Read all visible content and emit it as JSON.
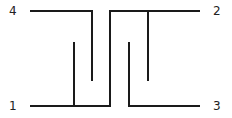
{
  "diagram": {
    "type": "interdigitated-coupler-schematic",
    "ports": [
      {
        "id": "port-4",
        "label": "4",
        "x": 13,
        "y": 15
      },
      {
        "id": "port-2",
        "label": "2",
        "x": 213,
        "y": 15
      },
      {
        "id": "port-1",
        "label": "1",
        "x": 13,
        "y": 110
      },
      {
        "id": "port-3",
        "label": "3",
        "x": 213,
        "y": 110
      }
    ],
    "line_color": "#1a1a1a",
    "label_color": "#222222"
  }
}
